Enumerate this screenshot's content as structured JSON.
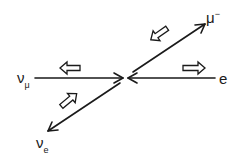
{
  "diagram": {
    "title": "",
    "colors": {
      "line": "#1a1a1a",
      "background": "#ffffff",
      "spin_arrow_fill": "#ffffff"
    },
    "vertex": {
      "x": 125,
      "y": 78
    },
    "particles": [
      {
        "id": "nu_mu",
        "symbol": "ν",
        "subscript": "μ",
        "superscript": "",
        "direction": "left",
        "momentum_arrow": "toward vertex",
        "spin_arrow": "left"
      },
      {
        "id": "e",
        "symbol": "e",
        "subscript": "",
        "superscript": "",
        "direction": "right",
        "momentum_arrow": "toward vertex",
        "spin_arrow": "right"
      },
      {
        "id": "mu_minus",
        "symbol": "μ",
        "subscript": "",
        "superscript": "−",
        "direction": "upper-right",
        "momentum_arrow": "away from vertex",
        "spin_arrow": "down-left"
      },
      {
        "id": "nu_e",
        "symbol": "ν",
        "subscript": "e",
        "superscript": "",
        "direction": "lower-left",
        "momentum_arrow": "away from vertex",
        "spin_arrow": "up-right"
      }
    ],
    "labels": {
      "nu_mu": {
        "main": "ν",
        "sub": "μ"
      },
      "e": {
        "main": "e"
      },
      "mu_minus": {
        "main": "μ",
        "sup": "−"
      },
      "nu_e": {
        "main": "ν",
        "sub": "e"
      }
    }
  }
}
